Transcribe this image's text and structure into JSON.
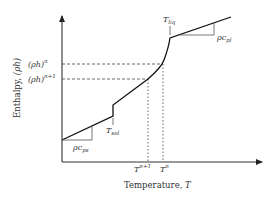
{
  "diagram": {
    "axes": {
      "ylabel_text": "Enthalpy, ",
      "ylabel_symbol": "(ρh)",
      "xlabel_text": "Temperature, ",
      "xlabel_symbol": "T"
    },
    "y_markers": [
      {
        "base": "(ρh)",
        "sup": "n"
      },
      {
        "base": "(ρh)",
        "sup": "n+1"
      }
    ],
    "x_markers": [
      {
        "base": "T",
        "sup": "n+1"
      },
      {
        "base": "T",
        "sup": "n"
      }
    ],
    "annotations": {
      "t_sol_base": "T",
      "t_sol_sub": "sol",
      "t_liq_base": "T",
      "t_liq_sub": "liq",
      "slope_solid_base": "ρc",
      "slope_solid_sub": "ps",
      "slope_liquid_base": "ρc",
      "slope_liquid_sub": "pl"
    },
    "colors": {
      "curve": "#111111",
      "axis": "#333333",
      "guide": "#444444",
      "label": "#333333"
    }
  }
}
